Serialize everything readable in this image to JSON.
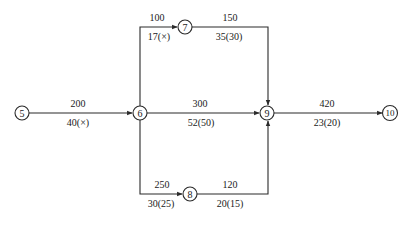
{
  "diagram": {
    "type": "network-flow",
    "nodes": [
      {
        "id": "5",
        "label": "5",
        "x": 22,
        "y": 113
      },
      {
        "id": "6",
        "label": "6",
        "x": 140,
        "y": 113
      },
      {
        "id": "7",
        "label": "7",
        "x": 185,
        "y": 27
      },
      {
        "id": "8",
        "label": "8",
        "x": 190,
        "y": 194
      },
      {
        "id": "9",
        "label": "9",
        "x": 267,
        "y": 113
      },
      {
        "id": "10",
        "label": "10",
        "x": 390,
        "y": 113
      }
    ],
    "edges": [
      {
        "from": "5",
        "to": "6",
        "capacity": "200",
        "cost_flow": "40(×)"
      },
      {
        "from": "6",
        "to": "7",
        "capacity": "100",
        "cost_flow": "17(×)"
      },
      {
        "from": "7",
        "to": "9",
        "capacity": "150",
        "cost_flow": "35(30)"
      },
      {
        "from": "6",
        "to": "9",
        "capacity": "300",
        "cost_flow": "52(50)"
      },
      {
        "from": "6",
        "to": "8",
        "capacity": "250",
        "cost_flow": "30(25)"
      },
      {
        "from": "8",
        "to": "9",
        "capacity": "120",
        "cost_flow": "20(15)"
      },
      {
        "from": "9",
        "to": "10",
        "capacity": "420",
        "cost_flow": "23(20)"
      }
    ]
  },
  "colors": {
    "line": "#2a2a2a",
    "text": "#1a1a1a",
    "background": "#ffffff"
  }
}
